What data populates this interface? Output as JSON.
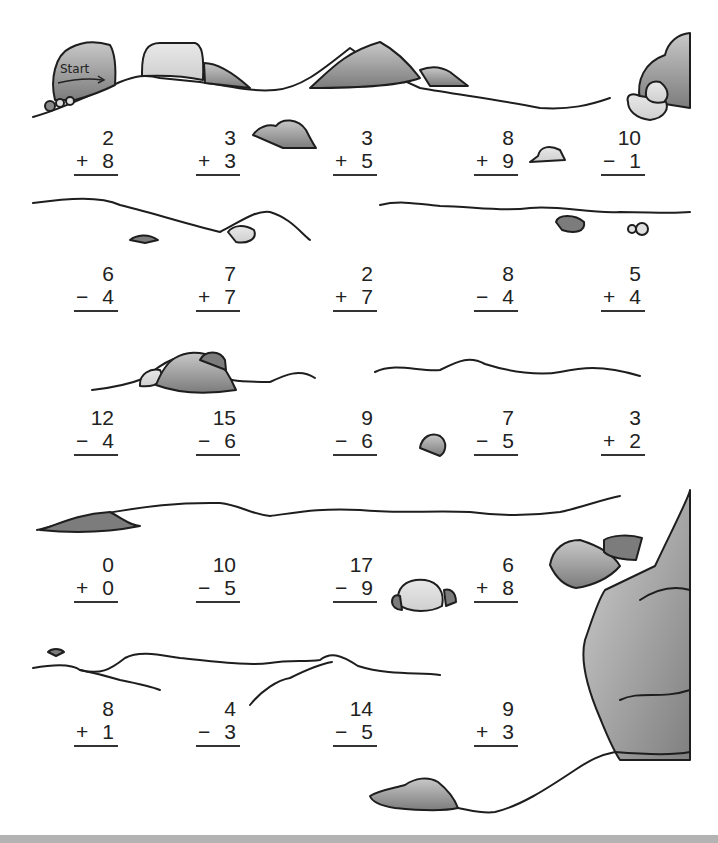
{
  "worksheet": {
    "start_label": "Start",
    "colors": {
      "ink": "#222222",
      "rock_dark": "#7a7a7a",
      "rock_light": "#d9d9d9",
      "bar": "#b3b3b3"
    },
    "rows": [
      {
        "problems": [
          {
            "top": "2",
            "op": "+",
            "bottom": "8"
          },
          {
            "top": "3",
            "op": "+",
            "bottom": "3"
          },
          {
            "top": "3",
            "op": "+",
            "bottom": "5"
          },
          {
            "top": "8",
            "op": "+",
            "bottom": "9"
          },
          {
            "top": "10",
            "op": "−",
            "bottom": "1"
          }
        ]
      },
      {
        "problems": [
          {
            "top": "6",
            "op": "−",
            "bottom": "4"
          },
          {
            "top": "7",
            "op": "+",
            "bottom": "7"
          },
          {
            "top": "2",
            "op": "+",
            "bottom": "7"
          },
          {
            "top": "8",
            "op": "−",
            "bottom": "4"
          },
          {
            "top": "5",
            "op": "+",
            "bottom": "4"
          }
        ]
      },
      {
        "problems": [
          {
            "top": "12",
            "op": "−",
            "bottom": "4"
          },
          {
            "top": "15",
            "op": "−",
            "bottom": "6"
          },
          {
            "top": "9",
            "op": "−",
            "bottom": "6"
          },
          {
            "top": "7",
            "op": "−",
            "bottom": "5"
          },
          {
            "top": "3",
            "op": "+",
            "bottom": "2"
          }
        ]
      },
      {
        "problems": [
          {
            "top": "0",
            "op": "+",
            "bottom": "0"
          },
          {
            "top": "10",
            "op": "−",
            "bottom": "5"
          },
          {
            "top": "17",
            "op": "−",
            "bottom": "9"
          },
          {
            "top": "6",
            "op": "+",
            "bottom": "8"
          }
        ]
      },
      {
        "problems": [
          {
            "top": "8",
            "op": "+",
            "bottom": "1"
          },
          {
            "top": "4",
            "op": "−",
            "bottom": "3"
          },
          {
            "top": "14",
            "op": "−",
            "bottom": "5"
          },
          {
            "top": "9",
            "op": "+",
            "bottom": "3"
          }
        ]
      }
    ]
  }
}
